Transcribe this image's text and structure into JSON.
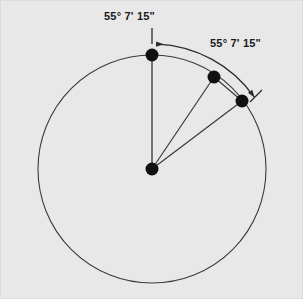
{
  "figure": {
    "name": "circle-central-angle-diagram",
    "background_color": "#e8e8e8",
    "border_color": "#dcdcdc",
    "stroke_color": "#3a3a3a",
    "point_color": "#111111",
    "labels": {
      "first_angle": "55° 7' 15\"",
      "second_angle": "55° 7' 15\""
    }
  },
  "chart_data": {
    "type": "diagram",
    "title": "",
    "subtitle": "",
    "xlabel": "",
    "ylabel": "",
    "geometry": {
      "circle": {
        "center_x": 152,
        "center_y": 169,
        "radius": 114,
        "stroke_width": 1.1
      },
      "points": [
        {
          "id": "center",
          "label": "",
          "x": 152,
          "y": 169,
          "radius": 6.5,
          "on_circle": false
        },
        {
          "id": "top",
          "label": "",
          "x": 152,
          "y": 55,
          "radius": 6.5,
          "on_circle": true,
          "angle_from_vertical_deg": 0
        },
        {
          "id": "second",
          "label": "",
          "x": 214,
          "y": 77,
          "radius": 6.5,
          "on_circle": true,
          "angle_from_vertical_deg": 33
        },
        {
          "id": "third",
          "label": "",
          "x": 242,
          "y": 101,
          "radius": 6.5,
          "on_circle": true,
          "angle_from_vertical_deg": 56
        }
      ],
      "segments": [
        {
          "id": "radius-to-top",
          "from": "center",
          "to": "top"
        },
        {
          "id": "radius-to-second",
          "from": "center",
          "to": "second"
        },
        {
          "id": "radius-to-third",
          "from": "center",
          "to": "third"
        },
        {
          "id": "chord-second-to-third",
          "from": "second",
          "to": "third"
        }
      ],
      "arcs": [
        {
          "id": "angle-arc",
          "radius": 125,
          "start_angle_from_vertical_deg": 0,
          "end_angle_from_vertical_deg": 57,
          "arrow_at_start": true,
          "arrow_at_end": true
        }
      ],
      "ticks": [
        {
          "id": "start-tick",
          "x1": 152,
          "y1": 28,
          "x2": 152,
          "y2": 44
        },
        {
          "id": "end-tick",
          "x1": 250,
          "y1": 102,
          "x2": 262,
          "y2": 90
        }
      ]
    },
    "annotations": [
      {
        "id": "first-angle-label",
        "text": "55° 7' 15\"",
        "x": 104,
        "y": 10
      },
      {
        "id": "second-angle-label",
        "text": "55° 7' 15\"",
        "x": 210,
        "y": 37
      }
    ]
  }
}
